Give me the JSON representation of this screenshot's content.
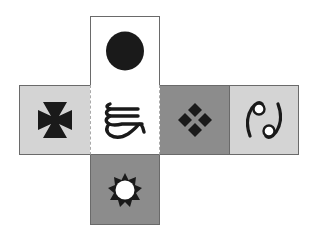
{
  "diagram": {
    "type": "cube-net",
    "layout": "cross",
    "faces": [
      {
        "position": "top",
        "symbol": "filled-circle",
        "fill": "#ffffff"
      },
      {
        "position": "left",
        "symbol": "cross-pattee",
        "fill": "#d4d4d4"
      },
      {
        "position": "center",
        "symbol": "stylized-glyph",
        "fill": "#ffffff"
      },
      {
        "position": "right",
        "symbol": "four-diamonds",
        "fill": "#8c8c8c"
      },
      {
        "position": "far-right",
        "symbol": "cancer-sign",
        "fill": "#d4d4d4"
      },
      {
        "position": "bottom",
        "symbol": "sun",
        "fill": "#8c8c8c"
      }
    ],
    "colors": {
      "light_gray": "#d4d4d4",
      "dark_gray": "#8c8c8c",
      "white": "#ffffff",
      "ink": "#1a1a1a",
      "border": "#6a6a6a"
    }
  }
}
